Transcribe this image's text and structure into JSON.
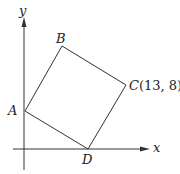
{
  "diagram": {
    "type": "coordinate-geometry",
    "axes": {
      "x_label": "x",
      "y_label": "y"
    },
    "vertices": [
      {
        "name": "A",
        "label": "A"
      },
      {
        "name": "B",
        "label": "B"
      },
      {
        "name": "C",
        "label": "C",
        "coords_label": "(13, 8)"
      },
      {
        "name": "D",
        "label": "D"
      }
    ],
    "colors": {
      "line": "#333333",
      "axis": "#333333"
    }
  }
}
